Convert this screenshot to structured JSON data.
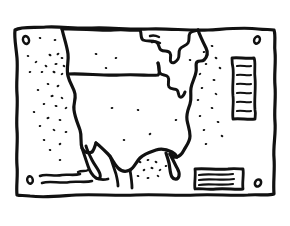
{
  "artwork": {
    "title": "United States Map Poster",
    "style": "hand-drawn black ink line art, coloring-book style",
    "background_color": "#ffffff",
    "ink_color": "#111111",
    "width": 290,
    "height": 226
  },
  "frame": {
    "name": "poster-border",
    "description": "wavy hand-drawn rectangular border",
    "stroke_width": 3.2,
    "corner_holes": [
      {
        "label": "top-left-pin-hole",
        "cx": 26,
        "cy": 40
      },
      {
        "label": "top-right-pin-hole",
        "cx": 257,
        "cy": 40
      },
      {
        "label": "bottom-left-pin-hole",
        "cx": 30,
        "cy": 180
      },
      {
        "label": "bottom-right-pin-hole",
        "cx": 258,
        "cy": 183
      }
    ]
  },
  "map": {
    "name": "usa-outline",
    "label": "United States outline with Great Lakes",
    "features": [
      "west-coast",
      "canada-border",
      "great-lakes",
      "east-coast",
      "gulf-coast",
      "florida-peninsula",
      "mexico-border"
    ]
  },
  "legend_box": {
    "name": "scale-legend-box",
    "orientation": "vertical",
    "position": "top-right",
    "x": 231,
    "y": 57,
    "width": 26,
    "height": 62,
    "tick_count": 6
  },
  "text_box": {
    "name": "caption-text-box",
    "orientation": "horizontal",
    "position": "bottom-right",
    "x": 194,
    "y": 168,
    "width": 48,
    "height": 26,
    "line_count": 3
  },
  "islands": {
    "name": "island-squiggles",
    "position": "bottom-left",
    "line_count": 3
  },
  "stipple": {
    "name": "ocean-stipple-dots",
    "description": "small ink dots filling the ocean areas on the west and east sides",
    "west_count": 30,
    "east_count": 16,
    "gulf_count": 12
  }
}
